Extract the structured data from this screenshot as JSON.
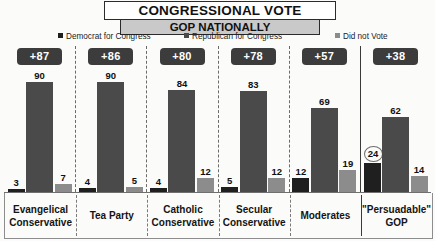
{
  "header": {
    "title": "CONGRESSIONAL VOTE",
    "subtitle": "GOP NATIONALLY"
  },
  "legend": {
    "items": [
      {
        "label": "Democrat for Congress",
        "color": "#1f1f1f",
        "icon": "legend-square-icon"
      },
      {
        "label": "Republican for Congress",
        "color": "#4a4a4a",
        "icon": "legend-square-icon"
      },
      {
        "label": "Did not Vote",
        "color": "#8c8c8c",
        "icon": "legend-square-icon"
      }
    ]
  },
  "badges": [
    {
      "label": "+87"
    },
    {
      "label": "+86"
    },
    {
      "label": "+80"
    },
    {
      "label": "+78"
    },
    {
      "label": "+57"
    },
    {
      "label": "+38"
    }
  ],
  "chart_data": {
    "type": "bar",
    "title": "CONGRESSIONAL VOTE",
    "subtitle": "GOP NATIONALLY",
    "xlabel": "",
    "ylabel": "",
    "ylim": [
      0,
      100
    ],
    "grid": false,
    "legend_position": "top",
    "categories": [
      "Evangelical Conservative",
      "Tea Party",
      "Catholic Conservative",
      "Secular Conservative",
      "Moderates",
      "\"Persuadable\" GOP"
    ],
    "category_lines": [
      [
        "Evangelical",
        "Conservative"
      ],
      [
        "Tea Party",
        ""
      ],
      [
        "Catholic",
        "Conservative"
      ],
      [
        "Secular",
        "Conservative"
      ],
      [
        "Moderates",
        ""
      ],
      [
        "\"Persuadable\"",
        "GOP"
      ]
    ],
    "series": [
      {
        "name": "Democrat for Congress",
        "color": "#1f1f1f",
        "values": [
          3,
          4,
          4,
          5,
          12,
          24
        ]
      },
      {
        "name": "Republican for Congress",
        "color": "#4a4a4a",
        "values": [
          90,
          90,
          84,
          83,
          69,
          62
        ]
      },
      {
        "name": "Did not Vote",
        "color": "#8c8c8c",
        "values": [
          7,
          5,
          12,
          12,
          19,
          14
        ]
      }
    ],
    "annotations": [
      {
        "text": "+87",
        "category": "Evangelical Conservative",
        "kind": "margin-badge"
      },
      {
        "text": "+86",
        "category": "Tea Party",
        "kind": "margin-badge"
      },
      {
        "text": "+80",
        "category": "Catholic Conservative",
        "kind": "margin-badge"
      },
      {
        "text": "+78",
        "category": "Secular Conservative",
        "kind": "margin-badge"
      },
      {
        "text": "+57",
        "category": "Moderates",
        "kind": "margin-badge"
      },
      {
        "text": "+38",
        "category": "\"Persuadable\" GOP",
        "kind": "margin-badge"
      },
      {
        "text": "24",
        "category": "\"Persuadable\" GOP",
        "series": "Democrat for Congress",
        "kind": "circled-value"
      }
    ]
  }
}
